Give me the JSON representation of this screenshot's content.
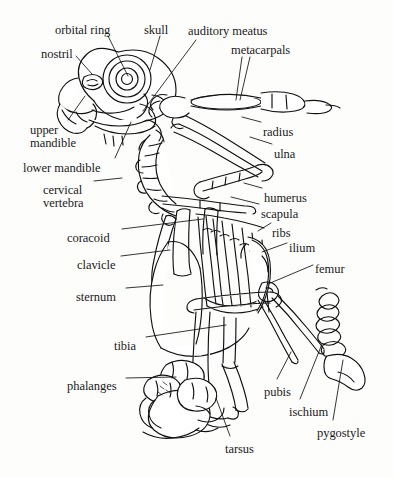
{
  "figure": {
    "type": "anatomical-diagram",
    "background_color": "#fdfdfc",
    "ink_color": "#111111",
    "label_color": "#1a1a1a"
  },
  "labels": [
    {
      "id": "orbital-ring",
      "text": "orbital ring",
      "x": 55,
      "y": 24,
      "align": "left"
    },
    {
      "id": "skull",
      "text": "skull",
      "x": 144,
      "y": 24,
      "align": "left"
    },
    {
      "id": "auditory-meatus",
      "text": "auditory meatus",
      "x": 188,
      "y": 25,
      "align": "left"
    },
    {
      "id": "nostril",
      "text": "nostril",
      "x": 41,
      "y": 48,
      "align": "left"
    },
    {
      "id": "metacarpals",
      "text": "metacarpals",
      "x": 231,
      "y": 44,
      "align": "left"
    },
    {
      "id": "radius",
      "text": "radius",
      "x": 263,
      "y": 126,
      "align": "left"
    },
    {
      "id": "ulna",
      "text": "ulna",
      "x": 274,
      "y": 148,
      "align": "left"
    },
    {
      "id": "upper-mandible",
      "text": "upper",
      "x": 30,
      "y": 124,
      "align": "left"
    },
    {
      "id": "upper-mandible-2",
      "text": "mandible",
      "x": 30,
      "y": 137,
      "align": "left"
    },
    {
      "id": "lower-mandible",
      "text": "lower mandible",
      "x": 23,
      "y": 162,
      "align": "left"
    },
    {
      "id": "cervical",
      "text": "cervical",
      "x": 43,
      "y": 184,
      "align": "left"
    },
    {
      "id": "vertebra",
      "text": "vertebra",
      "x": 43,
      "y": 197,
      "align": "left"
    },
    {
      "id": "humerus",
      "text": "humerus",
      "x": 264,
      "y": 192,
      "align": "left"
    },
    {
      "id": "scapula",
      "text": "scapula",
      "x": 261,
      "y": 208,
      "align": "left"
    },
    {
      "id": "ribs",
      "text": "ribs",
      "x": 272,
      "y": 227,
      "align": "left"
    },
    {
      "id": "coracoid",
      "text": "coracoid",
      "x": 67,
      "y": 232,
      "align": "left"
    },
    {
      "id": "ilium",
      "text": "ilium",
      "x": 289,
      "y": 242,
      "align": "left"
    },
    {
      "id": "clavicle",
      "text": "clavicle",
      "x": 77,
      "y": 259,
      "align": "left"
    },
    {
      "id": "femur",
      "text": "femur",
      "x": 315,
      "y": 263,
      "align": "left"
    },
    {
      "id": "sternum",
      "text": "sternum",
      "x": 76,
      "y": 291,
      "align": "left"
    },
    {
      "id": "tibia",
      "text": "tibia",
      "x": 114,
      "y": 340,
      "align": "left"
    },
    {
      "id": "phalanges",
      "text": "phalanges",
      "x": 67,
      "y": 380,
      "align": "left"
    },
    {
      "id": "pubis",
      "text": "pubis",
      "x": 264,
      "y": 386,
      "align": "left"
    },
    {
      "id": "ischium",
      "text": "ischium",
      "x": 289,
      "y": 406,
      "align": "left"
    },
    {
      "id": "pygostyle",
      "text": "pygostyle",
      "x": 317,
      "y": 427,
      "align": "left"
    },
    {
      "id": "tarsus",
      "text": "tarsus",
      "x": 225,
      "y": 443,
      "align": "left"
    }
  ],
  "leader_lines": [
    {
      "id": "leader-orbital-ring",
      "from": [
        108,
        36
      ],
      "to": [
        128,
        78
      ]
    },
    {
      "id": "leader-skull",
      "from": [
        160,
        36
      ],
      "to": [
        150,
        70
      ]
    },
    {
      "id": "leader-auditory-meatus",
      "from": [
        192,
        37
      ],
      "to": [
        182,
        54
      ]
    },
    {
      "id": "leader-auditory-meatus2",
      "from": [
        183,
        55
      ],
      "to": [
        143,
        110
      ]
    },
    {
      "id": "leader-nostril",
      "from": [
        76,
        56
      ],
      "to": [
        90,
        72
      ]
    },
    {
      "id": "leader-metacarpals-a",
      "from": [
        242,
        56
      ],
      "to": [
        237,
        100
      ]
    },
    {
      "id": "leader-metacarpals-b",
      "from": [
        248,
        56
      ],
      "to": [
        241,
        100
      ]
    },
    {
      "id": "leader-radius",
      "from": [
        261,
        123
      ],
      "to": [
        243,
        117
      ]
    },
    {
      "id": "leader-ulna",
      "from": [
        272,
        145
      ],
      "to": [
        250,
        138
      ]
    },
    {
      "id": "leader-upper-mandible",
      "from": [
        66,
        122
      ],
      "to": [
        84,
        96
      ]
    },
    {
      "id": "leader-lower-mandible",
      "from": [
        116,
        158
      ],
      "to": [
        129,
        122
      ]
    },
    {
      "id": "leader-cervical",
      "from": [
        94,
        183
      ],
      "to": [
        120,
        180
      ]
    },
    {
      "id": "leader-humerus",
      "from": [
        262,
        190
      ],
      "to": [
        243,
        184
      ]
    },
    {
      "id": "leader-scapula",
      "from": [
        259,
        205
      ],
      "to": [
        232,
        198
      ]
    },
    {
      "id": "leader-ribs",
      "from": [
        270,
        224
      ],
      "to": [
        256,
        230
      ]
    },
    {
      "id": "leader-coracoid",
      "from": [
        122,
        231
      ],
      "to": [
        202,
        220
      ]
    },
    {
      "id": "leader-ilium",
      "from": [
        287,
        243
      ],
      "to": [
        262,
        251
      ]
    },
    {
      "id": "leader-clavicle",
      "from": [
        121,
        258
      ],
      "to": [
        172,
        252
      ]
    },
    {
      "id": "leader-femur",
      "from": [
        313,
        265
      ],
      "to": [
        268,
        283
      ]
    },
    {
      "id": "leader-sternum",
      "from": [
        126,
        290
      ],
      "to": [
        162,
        287
      ]
    },
    {
      "id": "leader-tibia",
      "from": [
        146,
        339
      ],
      "to": [
        224,
        326
      ]
    },
    {
      "id": "leader-phalanges",
      "from": [
        126,
        380
      ],
      "to": [
        172,
        378
      ]
    },
    {
      "id": "leader-pubis",
      "from": [
        277,
        381
      ],
      "to": [
        290,
        355
      ]
    },
    {
      "id": "leader-ischium",
      "from": [
        300,
        401
      ],
      "to": [
        320,
        345
      ]
    },
    {
      "id": "leader-pygostyle",
      "from": [
        333,
        422
      ],
      "to": [
        341,
        360
      ]
    },
    {
      "id": "leader-tarsus",
      "from": [
        230,
        438
      ],
      "to": [
        215,
        400
      ]
    }
  ],
  "structures": [
    {
      "id": "skull-cranium",
      "name": "cranium"
    },
    {
      "id": "skull-orbital-ring",
      "name": "sclerotic/orbital ring"
    },
    {
      "id": "skull-nostril",
      "name": "nostril opening"
    },
    {
      "id": "beak-upper-mandible",
      "name": "upper mandible"
    },
    {
      "id": "beak-lower-mandible",
      "name": "lower mandible"
    },
    {
      "id": "cervical-vertebrae",
      "name": "cervical vertebral column"
    },
    {
      "id": "wing-humerus",
      "name": "humerus"
    },
    {
      "id": "wing-radius",
      "name": "radius"
    },
    {
      "id": "wing-ulna",
      "name": "ulna"
    },
    {
      "id": "wing-metacarpals",
      "name": "carpometacarpus"
    },
    {
      "id": "pectoral-scapula",
      "name": "scapula"
    },
    {
      "id": "pectoral-coracoid",
      "name": "coracoid"
    },
    {
      "id": "pectoral-clavicle",
      "name": "furcula / clavicle"
    },
    {
      "id": "sternum-keel",
      "name": "sternum with keel"
    },
    {
      "id": "rib-cage",
      "name": "ribs"
    },
    {
      "id": "pelvis-ilium",
      "name": "ilium"
    },
    {
      "id": "pelvis-pubis",
      "name": "pubis"
    },
    {
      "id": "pelvis-ischium",
      "name": "ischium"
    },
    {
      "id": "tail-pygostyle",
      "name": "pygostyle"
    },
    {
      "id": "leg-femur",
      "name": "femur"
    },
    {
      "id": "leg-tibia",
      "name": "tibiotarsus"
    },
    {
      "id": "leg-tarsus",
      "name": "tarsometatarsus"
    },
    {
      "id": "foot-phalanges",
      "name": "phalanges"
    }
  ]
}
